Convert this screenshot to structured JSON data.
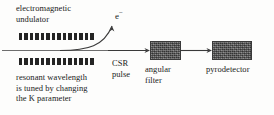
{
  "figure": {
    "width": 274,
    "height": 115,
    "background_color": "#fdfdfc"
  },
  "labels": {
    "undulator": "electromagnetic\nundulator",
    "tuning": "resonant wavelength\nis tuned by changing\nthe K parameter",
    "csr_pulse": "CSR\npulse",
    "angular_filter": "angular\nfilter",
    "pyrodetector": "pyrodetector",
    "electron_symbol": "e",
    "electron_charge": "−"
  },
  "undulator": {
    "magnet_count": 14,
    "magnet_color": "#242424",
    "rows": [
      "top",
      "bottom"
    ]
  },
  "beamline": {
    "color": "#6e6e6e"
  },
  "boxes": {
    "angular_filter": {
      "fill": "#585858",
      "stroke": "#3a3a3a"
    },
    "pyrodetector": {
      "fill": "#585858",
      "stroke": "#3a3a3a"
    }
  },
  "arrows": {
    "csr_radiation_arrow": "horizontal-right",
    "electron_deflection_arrow": "curved-up-right",
    "filter_to_detector_arrow": "horizontal-right"
  },
  "colors": {
    "line": "#3a3a3a",
    "text": "#1a1a1a",
    "magnet": "#242424"
  }
}
